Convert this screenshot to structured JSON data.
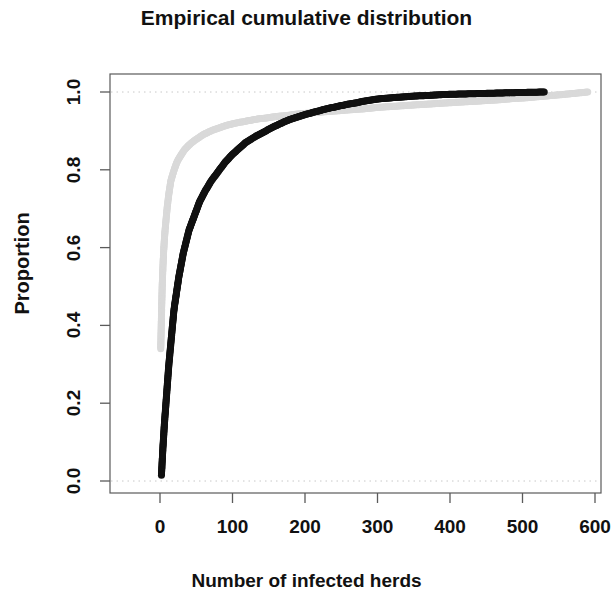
{
  "chart_data": {
    "type": "scatter",
    "title": "Empirical cumulative distribution",
    "xlabel": "Number of infected herds",
    "ylabel": "Proportion",
    "xlim": [
      -35,
      625
    ],
    "ylim": [
      -0.035,
      1.035
    ],
    "xticks": [
      0,
      100,
      200,
      300,
      400,
      500,
      600
    ],
    "xtick_labels": [
      "0",
      "100",
      "200",
      "300",
      "400",
      "500",
      "600"
    ],
    "yticks": [
      0.0,
      0.2,
      0.4,
      0.6,
      0.8,
      1.0
    ],
    "ytick_labels": [
      "0.0",
      "0.2",
      "0.4",
      "0.6",
      "0.8",
      "1.0"
    ],
    "grid": false,
    "gridlines_dotted_y": [
      0.0,
      1.0
    ],
    "legend": null,
    "box": true,
    "series": [
      {
        "name": "black-ecdf",
        "color": "#111111",
        "marker": "filled-circle",
        "marker_size": 7,
        "points": [
          [
            2,
            0.015
          ],
          [
            3,
            0.05
          ],
          [
            4,
            0.085
          ],
          [
            5,
            0.115
          ],
          [
            6,
            0.145
          ],
          [
            7,
            0.17
          ],
          [
            8,
            0.195
          ],
          [
            9,
            0.22
          ],
          [
            10,
            0.245
          ],
          [
            11,
            0.27
          ],
          [
            12,
            0.295
          ],
          [
            13,
            0.315
          ],
          [
            14,
            0.335
          ],
          [
            15,
            0.355
          ],
          [
            16,
            0.375
          ],
          [
            17,
            0.395
          ],
          [
            18,
            0.415
          ],
          [
            19,
            0.435
          ],
          [
            20,
            0.45
          ],
          [
            22,
            0.475
          ],
          [
            24,
            0.5
          ],
          [
            26,
            0.525
          ],
          [
            28,
            0.545
          ],
          [
            30,
            0.565
          ],
          [
            32,
            0.585
          ],
          [
            34,
            0.6
          ],
          [
            36,
            0.615
          ],
          [
            38,
            0.63
          ],
          [
            40,
            0.645
          ],
          [
            43,
            0.66
          ],
          [
            46,
            0.675
          ],
          [
            49,
            0.69
          ],
          [
            52,
            0.705
          ],
          [
            55,
            0.72
          ],
          [
            58,
            0.73
          ],
          [
            62,
            0.745
          ],
          [
            66,
            0.757
          ],
          [
            70,
            0.77
          ],
          [
            74,
            0.78
          ],
          [
            78,
            0.79
          ],
          [
            82,
            0.8
          ],
          [
            86,
            0.81
          ],
          [
            90,
            0.82
          ],
          [
            95,
            0.83
          ],
          [
            100,
            0.84
          ],
          [
            106,
            0.85
          ],
          [
            112,
            0.86
          ],
          [
            118,
            0.87
          ],
          [
            125,
            0.878
          ],
          [
            132,
            0.886
          ],
          [
            140,
            0.894
          ],
          [
            148,
            0.902
          ],
          [
            156,
            0.91
          ],
          [
            164,
            0.917
          ],
          [
            172,
            0.924
          ],
          [
            180,
            0.93
          ],
          [
            190,
            0.936
          ],
          [
            200,
            0.942
          ],
          [
            210,
            0.947
          ],
          [
            220,
            0.952
          ],
          [
            230,
            0.957
          ],
          [
            240,
            0.961
          ],
          [
            250,
            0.965
          ],
          [
            260,
            0.969
          ],
          [
            270,
            0.972
          ],
          [
            280,
            0.976
          ],
          [
            290,
            0.979
          ],
          [
            300,
            0.982
          ],
          [
            312,
            0.984
          ],
          [
            325,
            0.986
          ],
          [
            340,
            0.988
          ],
          [
            355,
            0.99
          ],
          [
            370,
            0.991
          ],
          [
            385,
            0.993
          ],
          [
            400,
            0.994
          ],
          [
            420,
            0.995
          ],
          [
            440,
            0.996
          ],
          [
            460,
            0.997
          ],
          [
            480,
            0.998
          ],
          [
            505,
            0.999
          ],
          [
            530,
            1.0
          ]
        ]
      },
      {
        "name": "gray-ecdf",
        "color": "#d9d9d9",
        "marker": "filled-circle",
        "marker_size": 7,
        "points": [
          [
            1,
            0.34
          ],
          [
            2,
            0.425
          ],
          [
            3,
            0.5
          ],
          [
            4,
            0.55
          ],
          [
            5,
            0.59
          ],
          [
            6,
            0.62
          ],
          [
            7,
            0.645
          ],
          [
            8,
            0.665
          ],
          [
            9,
            0.685
          ],
          [
            10,
            0.705
          ],
          [
            11,
            0.72
          ],
          [
            12,
            0.735
          ],
          [
            13,
            0.748
          ],
          [
            14,
            0.76
          ],
          [
            15,
            0.772
          ],
          [
            17,
            0.785
          ],
          [
            19,
            0.797
          ],
          [
            21,
            0.808
          ],
          [
            23,
            0.818
          ],
          [
            25,
            0.826
          ],
          [
            28,
            0.835
          ],
          [
            31,
            0.844
          ],
          [
            34,
            0.852
          ],
          [
            37,
            0.858
          ],
          [
            40,
            0.864
          ],
          [
            44,
            0.87
          ],
          [
            48,
            0.876
          ],
          [
            52,
            0.881
          ],
          [
            56,
            0.886
          ],
          [
            60,
            0.891
          ],
          [
            65,
            0.895
          ],
          [
            70,
            0.9
          ],
          [
            76,
            0.904
          ],
          [
            82,
            0.908
          ],
          [
            88,
            0.912
          ],
          [
            95,
            0.916
          ],
          [
            102,
            0.919
          ],
          [
            110,
            0.922
          ],
          [
            118,
            0.925
          ],
          [
            127,
            0.928
          ],
          [
            136,
            0.931
          ],
          [
            146,
            0.933
          ],
          [
            156,
            0.936
          ],
          [
            166,
            0.938
          ],
          [
            177,
            0.94
          ],
          [
            188,
            0.943
          ],
          [
            200,
            0.945
          ],
          [
            213,
            0.947
          ],
          [
            226,
            0.949
          ],
          [
            240,
            0.951
          ],
          [
            254,
            0.953
          ],
          [
            268,
            0.955
          ],
          [
            283,
            0.957
          ],
          [
            298,
            0.96
          ],
          [
            313,
            0.962
          ],
          [
            329,
            0.964
          ],
          [
            345,
            0.966
          ],
          [
            362,
            0.968
          ],
          [
            379,
            0.97
          ],
          [
            396,
            0.972
          ],
          [
            414,
            0.974
          ],
          [
            432,
            0.976
          ],
          [
            450,
            0.978
          ],
          [
            468,
            0.98
          ],
          [
            486,
            0.983
          ],
          [
            504,
            0.985
          ],
          [
            522,
            0.988
          ],
          [
            540,
            0.991
          ],
          [
            558,
            0.994
          ],
          [
            574,
            0.997
          ],
          [
            590,
            1.0
          ]
        ]
      }
    ]
  },
  "plot_geometry": {
    "box_left": 110,
    "box_right": 601,
    "box_top": 74,
    "box_bottom": 493,
    "x_px_at_0": 160,
    "x_px_per_unit": 0.725,
    "y_px_at_0": 481,
    "y_px_at_1": 92
  }
}
